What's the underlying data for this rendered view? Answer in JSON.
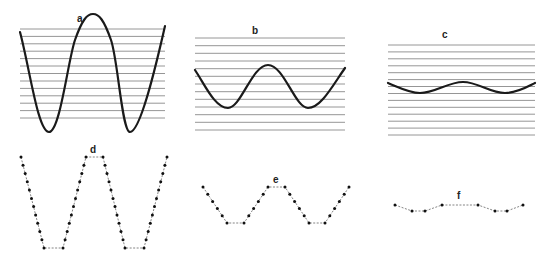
{
  "figure": {
    "panels": [
      {
        "id": "a",
        "label": "a",
        "type": "continuous-wave",
        "amplitude": "large",
        "grid_lines": 13,
        "grid": {
          "x1": 20,
          "x2": 165,
          "y_top": 29,
          "y_bottom": 118
        },
        "wave_points": [
          [
            20,
            32
          ],
          [
            49,
            132
          ],
          [
            93,
            14
          ],
          [
            130,
            132
          ],
          [
            165,
            26
          ]
        ]
      },
      {
        "id": "b",
        "label": "b",
        "type": "continuous-wave",
        "amplitude": "medium",
        "grid_lines": 13,
        "grid": {
          "x1": 195,
          "x2": 345,
          "y_top": 38,
          "y_bottom": 130
        },
        "wave_points": [
          [
            195,
            70
          ],
          [
            228,
            108
          ],
          [
            268,
            65
          ],
          [
            308,
            108
          ],
          [
            345,
            68
          ]
        ]
      },
      {
        "id": "c",
        "label": "c",
        "type": "continuous-wave",
        "amplitude": "small",
        "grid_lines": 14,
        "grid": {
          "x1": 388,
          "x2": 535,
          "y_top": 45,
          "y_bottom": 135
        },
        "wave_points": [
          [
            388,
            83
          ],
          [
            420,
            93
          ],
          [
            463,
            82
          ],
          [
            505,
            93
          ],
          [
            535,
            83
          ]
        ]
      },
      {
        "id": "d",
        "label": "d",
        "type": "quantized-dots",
        "vertices": [
          [
            21,
            157
          ],
          [
            44,
            248
          ],
          [
            63,
            248
          ],
          [
            86,
            157
          ],
          [
            103,
            157
          ],
          [
            125,
            248
          ],
          [
            144,
            248
          ],
          [
            167,
            157
          ]
        ],
        "dots_per_slope": 12
      },
      {
        "id": "e",
        "label": "e",
        "type": "quantized-dots",
        "vertices": [
          [
            203,
            187
          ],
          [
            227,
            223
          ],
          [
            244,
            223
          ],
          [
            268,
            187
          ],
          [
            285,
            187
          ],
          [
            309,
            223
          ],
          [
            325,
            223
          ],
          [
            349,
            187
          ]
        ],
        "dots_per_slope": 6
      },
      {
        "id": "f",
        "label": "f",
        "type": "quantized-dots",
        "vertices": [
          [
            395,
            205
          ],
          [
            412,
            211
          ],
          [
            425,
            211
          ],
          [
            442,
            205
          ],
          [
            478,
            205
          ],
          [
            495,
            211
          ],
          [
            507,
            211
          ],
          [
            523,
            205
          ]
        ],
        "dots_per_slope": 1
      }
    ]
  },
  "labels": {
    "a": "a",
    "b": "b",
    "c": "c",
    "d": "d",
    "e": "e",
    "f": "f"
  },
  "colors": {
    "wave": "#1a1a1a",
    "grid": "#8a8a8a",
    "dot": "#111111",
    "dotted_connector": "#777777"
  }
}
